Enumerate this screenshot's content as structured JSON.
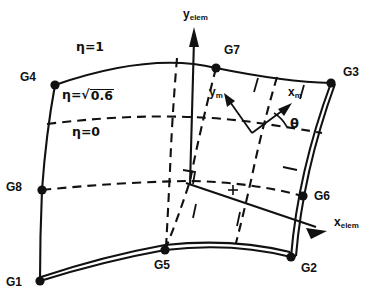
{
  "figure": {
    "type": "finite-element-geometry-diagram",
    "background": "#ffffff",
    "line_color": "#111111"
  },
  "nodes": [
    {
      "id": "G1",
      "label": "G1",
      "x": 40,
      "y": 281,
      "label_x": 6,
      "label_y": 282
    },
    {
      "id": "G2",
      "label": "G2",
      "x": 291,
      "y": 257,
      "label_x": 300,
      "label_y": 268
    },
    {
      "id": "G3",
      "label": "G3",
      "x": 331,
      "y": 83,
      "label_x": 343,
      "label_y": 72
    },
    {
      "id": "G4",
      "label": "G4",
      "x": 55,
      "y": 85,
      "label_x": 20,
      "label_y": 76
    },
    {
      "id": "G5",
      "label": "G5",
      "x": 165,
      "y": 250,
      "label_x": 154,
      "label_y": 263
    },
    {
      "id": "G6",
      "label": "G6",
      "x": 303,
      "y": 196,
      "label_x": 314,
      "label_y": 196
    },
    {
      "id": "G7",
      "label": "G7",
      "x": 216,
      "y": 68,
      "label_x": 224,
      "label_y": 49
    },
    {
      "id": "G8",
      "label": "G8",
      "x": 42,
      "y": 190,
      "label_x": 6,
      "label_y": 186
    }
  ],
  "iso_labels": [
    {
      "id": "eta-1",
      "text": "η=1",
      "x": 76,
      "y": 48,
      "kind": "plain"
    },
    {
      "id": "eta-sqrt",
      "prefix": "η=√",
      "radicand": "0.6",
      "x": 62,
      "y": 95,
      "kind": "radical"
    },
    {
      "id": "eta-0",
      "text": "η=0",
      "x": 72,
      "y": 133,
      "kind": "plain"
    }
  ],
  "axes": [
    {
      "id": "y-elem",
      "base": "y",
      "sub": "elem",
      "label_x": 183,
      "label_y": 14
    },
    {
      "id": "x-elem",
      "base": "x",
      "sub": "elem",
      "label_x": 334,
      "label_y": 222
    },
    {
      "id": "y-m",
      "base": "y",
      "sub": "m",
      "label_x": 212,
      "label_y": 92
    },
    {
      "id": "x-m",
      "base": "x",
      "sub": "m",
      "label_x": 286,
      "label_y": 93
    }
  ],
  "angle": {
    "id": "theta",
    "symbol": "θ",
    "x": 289,
    "y": 124
  },
  "markers": {
    "right_angle": {
      "x": 185,
      "y": 178,
      "size": 11
    },
    "cross_tick": {
      "x": 233,
      "y": 190,
      "size": 5
    },
    "material_origin": {
      "x": 252,
      "y": 133
    }
  },
  "edges": {
    "top": "solid-curve G4 to G3",
    "bottom": "double-line-curve G1 to G2",
    "left": "solid-curve G1 to G4",
    "right": "double-line G2 to G3",
    "dashed_eta_sqrt": "dashed curve from left edge to right edge (upper)",
    "dashed_eta_0": "dashed curve from G8 to G6 region (lower)"
  }
}
